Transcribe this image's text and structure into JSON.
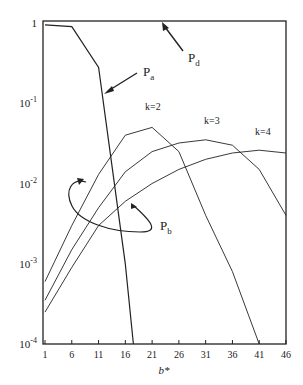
{
  "chart_data": {
    "type": "line",
    "title": "",
    "xlabel": "b*",
    "ylabel": "",
    "yscale": "log",
    "xlim": [
      1,
      46
    ],
    "ylim": [
      0.0001,
      1
    ],
    "grid": false,
    "x_ticks": [
      1,
      6,
      11,
      16,
      21,
      26,
      31,
      36,
      41,
      46
    ],
    "y_ticks": [
      {
        "value": 1,
        "label": "1"
      },
      {
        "value": 0.1,
        "label": "10",
        "exp": "-1"
      },
      {
        "value": 0.01,
        "label": "10",
        "exp": "-2"
      },
      {
        "value": 0.001,
        "label": "10",
        "exp": "-3"
      },
      {
        "value": 0.0001,
        "label": "10",
        "exp": "-4"
      }
    ],
    "series": [
      {
        "name": "Pa",
        "x": [
          1,
          6,
          11,
          16,
          17.5
        ],
        "values": [
          0.95,
          0.9,
          0.28,
          0.001,
          0.0001
        ]
      },
      {
        "name": "k=2",
        "x": [
          1,
          6,
          11,
          16,
          21,
          26,
          31,
          36,
          41
        ],
        "values": [
          0.0006,
          0.003,
          0.013,
          0.04,
          0.05,
          0.025,
          0.004,
          0.0008,
          0.0001
        ]
      },
      {
        "name": "k=3",
        "x": [
          1,
          6,
          11,
          16,
          21,
          26,
          31,
          36,
          41,
          46
        ],
        "values": [
          0.00035,
          0.0015,
          0.005,
          0.014,
          0.025,
          0.032,
          0.035,
          0.03,
          0.015,
          0.004
        ]
      },
      {
        "name": "k=4",
        "x": [
          1,
          6,
          11,
          16,
          21,
          26,
          31,
          36,
          41,
          46
        ],
        "values": [
          0.00025,
          0.0009,
          0.003,
          0.006,
          0.01,
          0.015,
          0.02,
          0.024,
          0.026,
          0.024
        ]
      }
    ],
    "annotations": [
      {
        "text": "P",
        "sub": "a",
        "target": "Pa curve"
      },
      {
        "text": "P",
        "sub": "d",
        "target": "top boundary"
      },
      {
        "text": "P",
        "sub": "b",
        "target": "k curves (loop bracket)"
      },
      {
        "text": "k=2"
      },
      {
        "text": "k=3"
      },
      {
        "text": "k=4"
      }
    ]
  },
  "labels": {
    "xlabel": "b*",
    "pa": "P",
    "pa_sub": "a",
    "pd": "P",
    "pd_sub": "d",
    "pb": "P",
    "pb_sub": "b",
    "k2": "k=2",
    "k3": "k=3",
    "k4": "k=4",
    "base": "10"
  }
}
